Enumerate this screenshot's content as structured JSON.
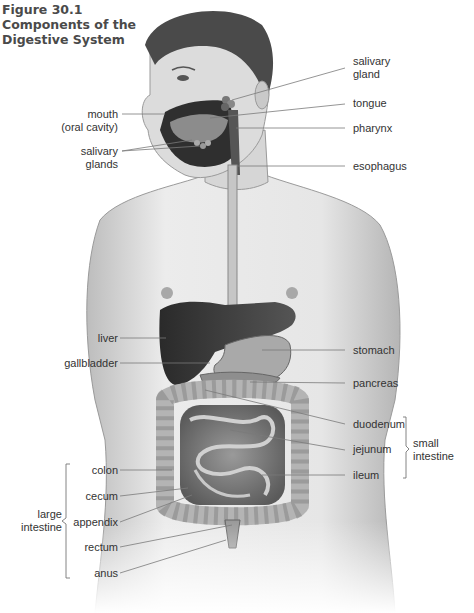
{
  "figure": {
    "number": "Figure 30.1",
    "title_line1": "Components of the",
    "title_line2": "Digestive System"
  },
  "labels_right": {
    "salivary_gland_1": "salivary",
    "salivary_gland_2": "gland",
    "tongue": "tongue",
    "pharynx": "pharynx",
    "esophagus": "esophagus",
    "stomach": "stomach",
    "pancreas": "pancreas",
    "duodenum": "duodenum",
    "jejunum": "jejunum",
    "ileum": "ileum"
  },
  "labels_left": {
    "mouth_1": "mouth",
    "mouth_2": "(oral cavity)",
    "salivary_glands_1": "salivary",
    "salivary_glands_2": "glands",
    "liver": "liver",
    "gallbladder": "gallbladder",
    "colon": "colon",
    "cecum": "cecum",
    "appendix": "appendix",
    "rectum": "rectum",
    "anus": "anus"
  },
  "groups": {
    "small_intestine_1": "small",
    "small_intestine_2": "intestine",
    "large_intestine_1": "large",
    "large_intestine_2": "intestine"
  },
  "colors": {
    "line": "#7a7a7a",
    "skin": "#d9d9d9",
    "organ_dark": "#3a3a3a",
    "organ_mid": "#8a8a8a"
  }
}
